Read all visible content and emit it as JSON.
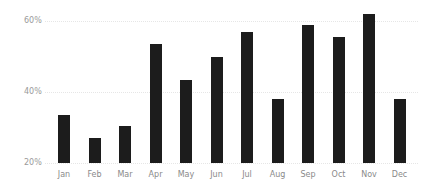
{
  "chart_data": {
    "type": "bar",
    "title": "",
    "xlabel": "",
    "ylabel": "",
    "categories": [
      "Jan",
      "Feb",
      "Mar",
      "Apr",
      "May",
      "Jun",
      "Jul",
      "Aug",
      "Sep",
      "Oct",
      "Nov",
      "Dec"
    ],
    "values": [
      33.5,
      27,
      30.5,
      53.5,
      43.5,
      50,
      57,
      38,
      59,
      55.5,
      62,
      38
    ],
    "value_unit": "%",
    "ylim": [
      20,
      64
    ],
    "yticks": [
      20,
      40,
      60
    ],
    "ytick_labels": [
      "20%",
      "40%",
      "60%"
    ],
    "grid": true,
    "legend": null,
    "bar_color": "#1c1c1c",
    "grid_color": "#e6e6e6"
  }
}
